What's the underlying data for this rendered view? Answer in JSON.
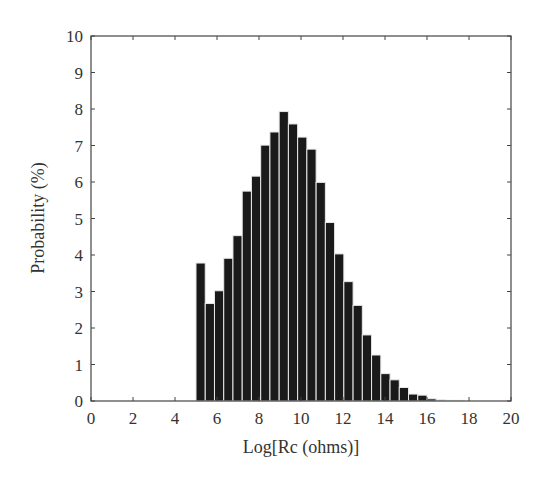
{
  "chart_data": {
    "type": "bar",
    "title": "",
    "xlabel": "Log[Rc (ohms)]",
    "ylabel": "Probability (%)",
    "xlim": [
      0,
      20
    ],
    "ylim": [
      0,
      10
    ],
    "xticks": [
      0,
      2,
      4,
      6,
      8,
      10,
      12,
      14,
      16,
      18,
      20
    ],
    "yticks": [
      0,
      1,
      2,
      3,
      4,
      5,
      6,
      7,
      8,
      9,
      10
    ],
    "grid": false,
    "legend": null,
    "bin_start": 5.0,
    "bin_width": 0.44,
    "bin_left_edges": [
      5.0,
      5.44,
      5.88,
      6.32,
      6.76,
      7.2,
      7.64,
      8.08,
      8.52,
      8.96,
      9.4,
      9.84,
      10.28,
      10.72,
      11.16,
      11.6,
      12.04,
      12.48,
      12.92,
      13.36,
      13.8,
      14.24,
      14.68,
      15.12,
      15.56,
      16.0,
      16.44,
      16.88,
      17.32
    ],
    "values": [
      3.78,
      2.67,
      3.02,
      3.91,
      4.53,
      5.75,
      6.16,
      7.01,
      7.37,
      7.93,
      7.59,
      7.23,
      6.9,
      5.99,
      4.89,
      4.03,
      3.27,
      2.62,
      1.81,
      1.26,
      0.75,
      0.58,
      0.37,
      0.19,
      0.16,
      0.06,
      0.03,
      0.02,
      0.02
    ],
    "bar_color": "#1a1a1a",
    "bar_edge_color": "#e8e8e8"
  }
}
